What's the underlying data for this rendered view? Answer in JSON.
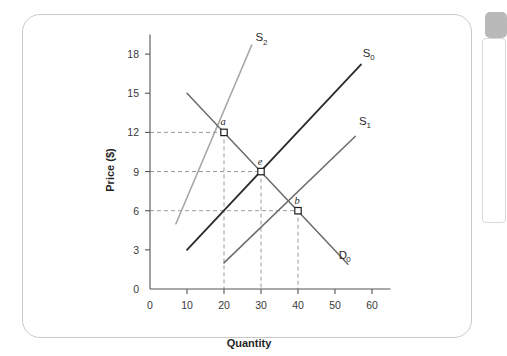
{
  "figure": {
    "card_label": "supply-demand-figure-card",
    "background_color": "#ffffff",
    "border_color": "#c9c9c9"
  },
  "right_panel": {
    "chip_color": "#b9b9b9",
    "panel_border": "#d8d8d8"
  },
  "chart_data": {
    "type": "line",
    "title": "",
    "subtitle": "",
    "xlabel": "Quantity",
    "ylabel": "Price ($)",
    "xlim": [
      0,
      65
    ],
    "ylim": [
      0,
      19.5
    ],
    "xticks": [
      0,
      10,
      20,
      30,
      40,
      50,
      60
    ],
    "xticklabels": [
      "0",
      "10",
      "20",
      "30",
      "40",
      "50",
      "60"
    ],
    "yticks": [
      0,
      3,
      6,
      9,
      12,
      15,
      18
    ],
    "yticklabels": [
      "0",
      "3",
      "6",
      "9",
      "12",
      "15",
      "18"
    ],
    "grid": false,
    "legend_position": "inline-curve-labels",
    "series": [
      {
        "name": "S0",
        "label": "S",
        "subscript": "0",
        "role": "supply",
        "color": "#2d2d2d",
        "width": 1.9,
        "points": [
          [
            10,
            3.0
          ],
          [
            57,
            17.2
          ]
        ],
        "label_x": 57.5,
        "label_y": 17.8
      },
      {
        "name": "S1",
        "label": "S",
        "subscript": "1",
        "role": "supply",
        "color": "#6b6b6b",
        "width": 1.5,
        "points": [
          [
            20,
            2.0
          ],
          [
            55.5,
            11.7
          ]
        ],
        "label_x": 56.5,
        "label_y": 12.6
      },
      {
        "name": "S2",
        "label": "S",
        "subscript": "2",
        "role": "supply",
        "color": "#a6a6a6",
        "width": 1.6,
        "points": [
          [
            7,
            5.0
          ],
          [
            27.5,
            18.7
          ]
        ],
        "label_x": 28.5,
        "label_y": 19.0
      },
      {
        "name": "D0",
        "label": "D",
        "subscript": "0",
        "role": "demand",
        "color": "#6b6b6b",
        "width": 1.5,
        "points": [
          [
            10,
            15.0
          ],
          [
            53.5,
            1.9
          ]
        ],
        "label_x": 51.0,
        "label_y": 2.3
      }
    ],
    "equilibrium_points": [
      {
        "name": "a",
        "quantity": 20,
        "price": 12,
        "curves": [
          "S2",
          "D0"
        ]
      },
      {
        "name": "e",
        "quantity": 30,
        "price": 9,
        "curves": [
          "S0",
          "D0"
        ]
      },
      {
        "name": "b",
        "quantity": 40,
        "price": 6,
        "curves": [
          "S1",
          "D0"
        ]
      }
    ],
    "guide_lines": [
      {
        "for": "a",
        "horizontal_from_price": 12,
        "vertical_from_quantity": 20
      },
      {
        "for": "e",
        "horizontal_from_price": 9,
        "vertical_from_quantity": 30
      },
      {
        "for": "b",
        "horizontal_from_price": 6,
        "vertical_from_quantity": 40
      }
    ],
    "annotations": [
      "Point a is the equilibrium of S2 with D0 at quantity 20 and price $12.",
      "Point e is the equilibrium of S0 with D0 at quantity 30 and price $9.",
      "Point b is the equilibrium of S1 with D0 at quantity 40 and price $6."
    ],
    "colors": {
      "axis": "#555555",
      "guide": "#9a9a9a",
      "marker_fill": "#ffffff",
      "marker_stroke": "#1f1f1f",
      "text": "#1f1f1f"
    }
  }
}
